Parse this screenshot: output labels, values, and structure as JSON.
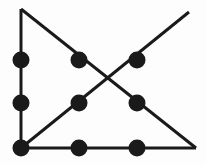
{
  "figure": {
    "type": "graph-diagram",
    "width": 206,
    "height": 164,
    "background_color": "#fdfdfd",
    "stroke_color": "#1a1a1a",
    "node_fill_color": "#1a1a1a",
    "edge_stroke_width": 3,
    "node_radius": 8.5,
    "title": "",
    "caption": ""
  },
  "chart_data": {
    "type": "scatter",
    "title": "",
    "xlabel": "",
    "ylabel": "",
    "grid": false,
    "legend": null,
    "xlim": [
      0,
      206
    ],
    "ylim": [
      0,
      164
    ],
    "nodes": [
      {
        "id": "n1",
        "label": "",
        "x": 21,
        "y": 60
      },
      {
        "id": "n2",
        "label": "",
        "x": 21,
        "y": 103
      },
      {
        "id": "n3",
        "label": "",
        "x": 21,
        "y": 148
      },
      {
        "id": "n4",
        "label": "",
        "x": 79,
        "y": 60
      },
      {
        "id": "n5",
        "label": "",
        "x": 79,
        "y": 103
      },
      {
        "id": "n6",
        "label": "",
        "x": 79,
        "y": 148
      },
      {
        "id": "n7",
        "label": "",
        "x": 137,
        "y": 60
      },
      {
        "id": "n8",
        "label": "",
        "x": 137,
        "y": 103
      },
      {
        "id": "n9",
        "label": "",
        "x": 137,
        "y": 148
      }
    ],
    "lines": [
      {
        "id": "vertical-left",
        "x1": 21,
        "y1": 9,
        "x2": 21,
        "y2": 148
      },
      {
        "id": "horizontal-bottom",
        "x1": 21,
        "y1": 148,
        "x2": 196,
        "y2": 148
      },
      {
        "id": "diagonal-descending",
        "x1": 21,
        "y1": 9,
        "x2": 196,
        "y2": 148
      },
      {
        "id": "diagonal-ascending",
        "x1": 21,
        "y1": 148,
        "x2": 189,
        "y2": 12
      }
    ],
    "crossing_point": {
      "x": 110,
      "y": 81
    }
  }
}
